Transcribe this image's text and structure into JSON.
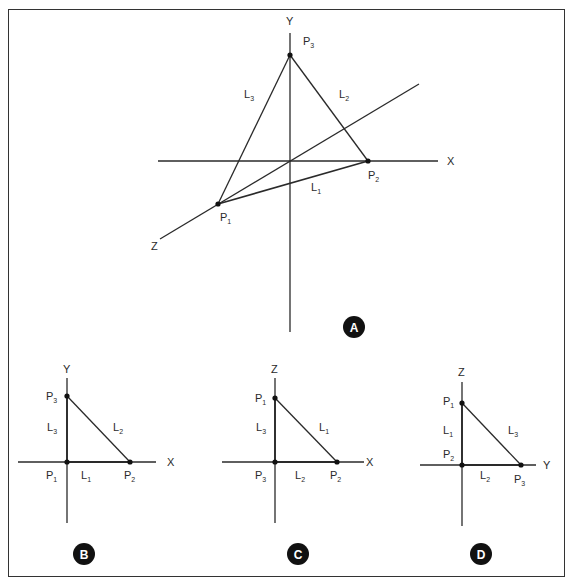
{
  "figure": {
    "style": {
      "line_color": "#2a2a2a",
      "badge_fill": "#111111",
      "badge_text_color": "#ffffff",
      "frame_color": "#333333"
    },
    "panels": [
      {
        "id": "A",
        "badge": "A",
        "description": "3D axes with triangle P1-P2-P3",
        "axes": [
          {
            "label": "Y"
          },
          {
            "label": "X"
          },
          {
            "label": "Z"
          }
        ],
        "points": [
          {
            "name": "P",
            "sub": "1"
          },
          {
            "name": "P",
            "sub": "2"
          },
          {
            "name": "P",
            "sub": "3"
          }
        ],
        "lines": [
          {
            "name": "L",
            "sub": "1"
          },
          {
            "name": "L",
            "sub": "2"
          },
          {
            "name": "L",
            "sub": "3"
          }
        ]
      },
      {
        "id": "B",
        "badge": "B",
        "description": "XY projection",
        "axes": [
          {
            "label": "Y"
          },
          {
            "label": "X"
          }
        ],
        "points": [
          {
            "name": "P",
            "sub": "3"
          },
          {
            "name": "P",
            "sub": "1"
          },
          {
            "name": "P",
            "sub": "2"
          }
        ],
        "lines": [
          {
            "name": "L",
            "sub": "3"
          },
          {
            "name": "L",
            "sub": "2"
          },
          {
            "name": "L",
            "sub": "1"
          }
        ]
      },
      {
        "id": "C",
        "badge": "C",
        "description": "XZ projection",
        "axes": [
          {
            "label": "Z"
          },
          {
            "label": "X"
          }
        ],
        "points": [
          {
            "name": "P",
            "sub": "1"
          },
          {
            "name": "P",
            "sub": "3"
          },
          {
            "name": "P",
            "sub": "2"
          }
        ],
        "lines": [
          {
            "name": "L",
            "sub": "3"
          },
          {
            "name": "L",
            "sub": "1"
          },
          {
            "name": "L",
            "sub": "2"
          }
        ]
      },
      {
        "id": "D",
        "badge": "D",
        "description": "YZ projection",
        "axes": [
          {
            "label": "Z"
          },
          {
            "label": "Y"
          }
        ],
        "points": [
          {
            "name": "P",
            "sub": "1"
          },
          {
            "name": "P",
            "sub": "2"
          },
          {
            "name": "P",
            "sub": "3"
          }
        ],
        "lines": [
          {
            "name": "L",
            "sub": "1"
          },
          {
            "name": "L",
            "sub": "3"
          },
          {
            "name": "L",
            "sub": "2"
          }
        ]
      }
    ]
  }
}
